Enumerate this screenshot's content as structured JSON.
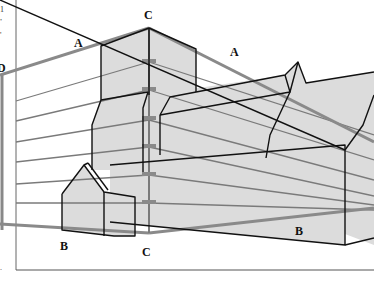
{
  "figure": {
    "type": "two-point perspective drawing",
    "colors": {
      "building_fill": "#dcdcdc",
      "outline": "#111111",
      "guide_line": "#7a7a7a",
      "horizon_thick": "#8a8a8a",
      "frame": "#555555"
    }
  },
  "labels": {
    "a_left": "A",
    "a_right": "A",
    "c_top": "C",
    "c_bottom": "C",
    "b_left": "B",
    "b_right": "B",
    "d_left": "D"
  },
  "margin_text": {
    "line1": "1",
    "line2": ",",
    "line3": "'",
    "line4": "."
  }
}
